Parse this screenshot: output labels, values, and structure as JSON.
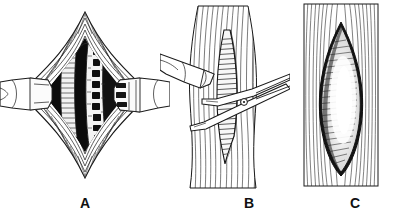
{
  "figure": {
    "background_color": "#ffffff",
    "ink_color": "#1a1a1a",
    "panel_count": 3
  },
  "panels": [
    {
      "id": "panel-a",
      "label": "A",
      "caption": "Wound held open by handheld retractors exposing the underlying structure",
      "elements": [
        {
          "name": "left-retractor",
          "label": "Retractor blade (left)"
        },
        {
          "name": "right-retractor",
          "label": "Toothed retractor blade (right)"
        },
        {
          "name": "wound-cavity",
          "label": "Deep wound cavity"
        },
        {
          "name": "exposed-structure",
          "label": "Exposed tendon/vessel"
        },
        {
          "name": "skin-edge",
          "label": "Everted skin and fascial edges"
        }
      ]
    },
    {
      "id": "panel-b",
      "label": "B",
      "caption": "Scissors dividing the muscle along its fibers while a retractor lifts the edge",
      "elements": [
        {
          "name": "muscle-belly",
          "label": "Muscle belly with longitudinal fibers"
        },
        {
          "name": "split-incision",
          "label": "Longitudinal split in muscle"
        },
        {
          "name": "scissors",
          "label": "Dissecting scissors"
        },
        {
          "name": "retractor",
          "label": "Retractor blade"
        }
      ]
    },
    {
      "id": "panel-c",
      "label": "C",
      "caption": "Completed fusiform opening through the muscle",
      "elements": [
        {
          "name": "muscle-sheath",
          "label": "Muscle sheath with striations"
        },
        {
          "name": "fusiform-opening",
          "label": "Lens-shaped (fusiform) opening"
        },
        {
          "name": "opening-floor",
          "label": "Pale tissue floor of opening"
        }
      ]
    }
  ],
  "labels": {
    "a": "A",
    "b": "B",
    "c": "C"
  }
}
